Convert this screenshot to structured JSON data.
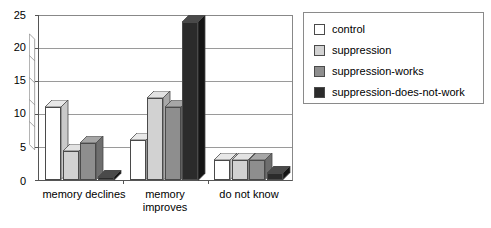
{
  "chart_data": {
    "type": "bar",
    "title": "",
    "subtitle": "",
    "xlabel": "",
    "ylabel": "",
    "categories": [
      "memory declines",
      "memory improves",
      "do not know"
    ],
    "category_lines": [
      [
        "memory declines"
      ],
      [
        "memory",
        "improves"
      ],
      [
        "do not know"
      ]
    ],
    "series": [
      {
        "name": "control",
        "color": "#ffffff",
        "side_color": "#c9c9c9",
        "top_color": "#e8e8e8",
        "values": [
          11,
          6,
          3
        ]
      },
      {
        "name": "suppression",
        "color": "#d2d2d2",
        "side_color": "#a8a8a8",
        "top_color": "#e2e2e2",
        "values": [
          4.4,
          12.5,
          3
        ]
      },
      {
        "name": "suppression-works",
        "color": "#8e8e8e",
        "side_color": "#6e6e6e",
        "top_color": "#a6a6a6",
        "values": [
          5.6,
          11,
          3
        ]
      },
      {
        "name": "suppression-does-not-work",
        "color": "#2b2b2b",
        "side_color": "#151515",
        "top_color": "#4a4a4a",
        "values": [
          0.5,
          24,
          1
        ]
      }
    ],
    "yticks": [
      0,
      5,
      10,
      15,
      20,
      25
    ],
    "ylim": [
      0,
      25
    ],
    "grid": true,
    "legend_position": "right",
    "legend_entries": [
      "control",
      "suppression",
      "suppression-works",
      "suppression-does-not-work"
    ]
  },
  "axis": {
    "tick_0": "0",
    "tick_5": "5",
    "tick_10": "10",
    "tick_15": "15",
    "tick_20": "20",
    "tick_25": "25"
  },
  "xlabels": {
    "g0_l0": "memory declines",
    "g1_l0": "memory",
    "g1_l1": "improves",
    "g2_l0": "do not know"
  },
  "legend": {
    "item0": "control",
    "item1": "suppression",
    "item2": "suppression-works",
    "item3": "suppression-does-not-work"
  }
}
